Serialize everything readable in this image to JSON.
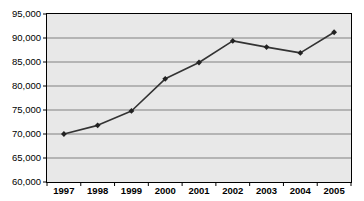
{
  "chart_data": {
    "type": "line",
    "title": "",
    "subtitle": "",
    "xlabel": "",
    "ylabel": "",
    "categories": [
      "1997",
      "1998",
      "1999",
      "2000",
      "2001",
      "2002",
      "2003",
      "2004",
      "2005"
    ],
    "values": [
      70000,
      71800,
      74800,
      81500,
      84900,
      89400,
      88100,
      86900,
      91200
    ],
    "series": [
      {
        "name": "",
        "values": [
          70000,
          71800,
          74800,
          81500,
          84900,
          89400,
          88100,
          86900,
          91200
        ]
      }
    ],
    "ylim": [
      60000,
      95000
    ],
    "ytick_step": 5000,
    "ytick_labels": [
      "95,000",
      "90,000",
      "85,000",
      "80,000",
      "75,000",
      "70,000",
      "65,000",
      "60,000"
    ],
    "ytick_values": [
      95000,
      90000,
      85000,
      80000,
      75000,
      70000,
      65000,
      60000
    ],
    "xtick_labels": [
      "1997",
      "1998",
      "1999",
      "2000",
      "2001",
      "2002",
      "2003",
      "2004",
      "2005"
    ],
    "grid": "horizontal",
    "legend": "none",
    "marker": "diamond",
    "colors": {
      "line": "#333333",
      "marker": "#222222",
      "plot_background": "#e8e8e8",
      "grid": "#808080",
      "axis": "#000000",
      "text": "#000000"
    }
  }
}
